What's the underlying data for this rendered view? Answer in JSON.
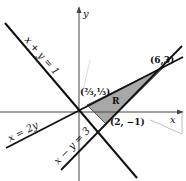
{
  "diagram": {
    "axes": {
      "x_label": "x",
      "y_label": "y"
    },
    "lines": [
      {
        "id": "l1",
        "label": "x + y = 1"
      },
      {
        "id": "l2",
        "label": "x = 2y"
      },
      {
        "id": "l3",
        "label": "x − y = 3"
      }
    ],
    "region": {
      "label": "R",
      "fill": "#a8a8a8"
    },
    "points": [
      {
        "label": "(⅔,⅓)",
        "x": 0.6667,
        "y": 0.3333
      },
      {
        "label": "(2, −1)",
        "x": 2,
        "y": -1
      },
      {
        "label": "(6,3)",
        "x": 6,
        "y": 3
      }
    ]
  }
}
